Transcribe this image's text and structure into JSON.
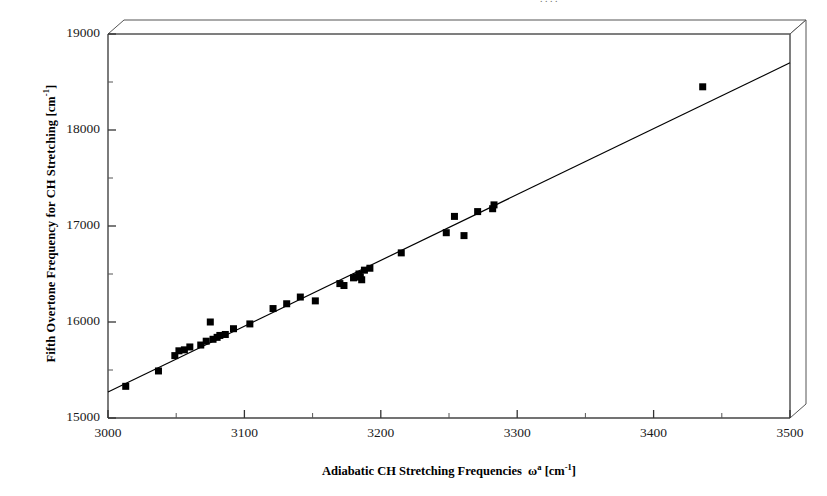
{
  "figure": {
    "background_color": "#ffffff",
    "foreground_color": "#000000",
    "top_cropped_text": ". .   .    ."
  },
  "annotation": {
    "r2_prefix": "R",
    "r2_exponent": "2",
    "r2_value": " = 0.990"
  },
  "axes": {
    "x_title_main": "Adiabatic CH Stretching Frequencies",
    "x_title_symbol": "ω",
    "x_title_symbol_sup": "a",
    "x_title_unit_open": " [cm",
    "x_title_unit_sup": "-1",
    "x_title_unit_close": "]",
    "y_title_main": "Fifth Overtone Frequency for CH Stretching [cm",
    "y_title_sup": "-1",
    "y_title_close": "]"
  },
  "chart_data": {
    "type": "scatter",
    "title": "",
    "xlabel": "Adiabatic CH Stretching Frequencies  ωa [cm-1]",
    "ylabel": "Fifth Overtone Frequency for CH Stretching [cm-1]",
    "xlim": [
      3000,
      3500
    ],
    "ylim": [
      15000,
      19000
    ],
    "xticks": [
      3000,
      3100,
      3200,
      3300,
      3400,
      3500
    ],
    "xtick_labels": [
      "3000",
      "3100",
      "3200",
      "3300",
      "3400",
      "3500"
    ],
    "yticks": [
      15000,
      16000,
      17000,
      18000,
      19000
    ],
    "ytick_labels": [
      "15000",
      "16000",
      "17000",
      "18000",
      "19000"
    ],
    "minor_xticks": [
      3050,
      3150,
      3250,
      3350,
      3450
    ],
    "minor_yticks": [
      15500,
      16500,
      17500,
      18500
    ],
    "grid": false,
    "legend": false,
    "marker": "square",
    "marker_color": "#000000",
    "marker_size": 7,
    "annotations": [
      {
        "text": "R2 = 0.990",
        "x": 3090,
        "y": 18050
      }
    ],
    "trendline": {
      "type": "linear",
      "r_squared": 0.99,
      "x_start": 3000,
      "y_start": 15270,
      "x_end": 3500,
      "y_end": 18700,
      "color": "#000000",
      "width": 1.2
    },
    "points": [
      {
        "x": 3013,
        "y": 15330
      },
      {
        "x": 3037,
        "y": 15490
      },
      {
        "x": 3049,
        "y": 15650
      },
      {
        "x": 3052,
        "y": 15700
      },
      {
        "x": 3056,
        "y": 15710
      },
      {
        "x": 3060,
        "y": 15740
      },
      {
        "x": 3068,
        "y": 15760
      },
      {
        "x": 3072,
        "y": 15800
      },
      {
        "x": 3075,
        "y": 16000
      },
      {
        "x": 3077,
        "y": 15820
      },
      {
        "x": 3080,
        "y": 15840
      },
      {
        "x": 3082,
        "y": 15860
      },
      {
        "x": 3086,
        "y": 15870
      },
      {
        "x": 3092,
        "y": 15930
      },
      {
        "x": 3104,
        "y": 15980
      },
      {
        "x": 3121,
        "y": 16140
      },
      {
        "x": 3131,
        "y": 16190
      },
      {
        "x": 3141,
        "y": 16260
      },
      {
        "x": 3152,
        "y": 16220
      },
      {
        "x": 3170,
        "y": 16400
      },
      {
        "x": 3173,
        "y": 16380
      },
      {
        "x": 3180,
        "y": 16460
      },
      {
        "x": 3182,
        "y": 16470
      },
      {
        "x": 3184,
        "y": 16500
      },
      {
        "x": 3185,
        "y": 16470
      },
      {
        "x": 3186,
        "y": 16440
      },
      {
        "x": 3188,
        "y": 16540
      },
      {
        "x": 3192,
        "y": 16560
      },
      {
        "x": 3215,
        "y": 16720
      },
      {
        "x": 3248,
        "y": 16930
      },
      {
        "x": 3254,
        "y": 17100
      },
      {
        "x": 3261,
        "y": 16900
      },
      {
        "x": 3271,
        "y": 17150
      },
      {
        "x": 3282,
        "y": 17180
      },
      {
        "x": 3283,
        "y": 17220
      },
      {
        "x": 3436,
        "y": 18450
      }
    ]
  }
}
